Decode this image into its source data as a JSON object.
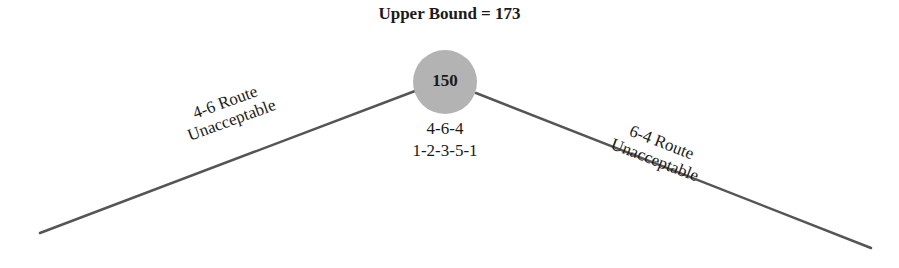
{
  "diagram": {
    "title": "Upper Bound = 173",
    "node": {
      "value": "150",
      "fill": "#b3b3b3"
    },
    "node_sequences": [
      "4-6-4",
      "1-2-3-5-1"
    ],
    "left_branch": {
      "line1": "4-6 Route",
      "line2": "Unacceptable"
    },
    "right_branch": {
      "line1": "6-4 Route",
      "line2": "Unacceptable"
    },
    "line_color": "#555555"
  }
}
